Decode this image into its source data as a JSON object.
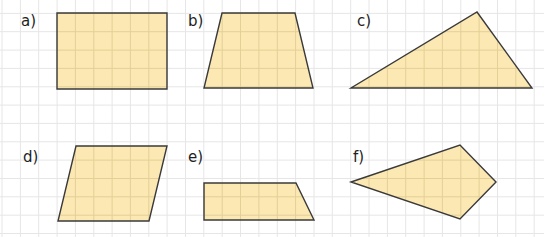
{
  "figure": {
    "grid": {
      "cell_px": 18.35,
      "origin_x": 2.0,
      "origin_y": -5.0,
      "line_color": "#e6e6e6",
      "extent_x": [
        0,
        544
      ],
      "extent_y": [
        0,
        237
      ]
    },
    "colors": {
      "fill": "#fbe8b3",
      "inner_grid": "#e3cf97",
      "stroke": "#3a3a3a",
      "label": "#1e1e1e"
    },
    "shapes": [
      {
        "id": "a",
        "label": "a)",
        "type": "rectangle",
        "label_pos": [
          21,
          14
        ],
        "points": [
          [
            57,
            13
          ],
          [
            167,
            13
          ],
          [
            167,
            89
          ],
          [
            57,
            89
          ]
        ]
      },
      {
        "id": "b",
        "label": "b)",
        "type": "trapezoid",
        "label_pos": [
          188,
          14
        ],
        "points": [
          [
            222,
            13
          ],
          [
            295,
            13
          ],
          [
            313,
            88
          ],
          [
            204,
            88
          ]
        ]
      },
      {
        "id": "c",
        "label": "c)",
        "type": "triangle",
        "label_pos": [
          357,
          14
        ],
        "points": [
          [
            477,
            12
          ],
          [
            532,
            88
          ],
          [
            351,
            88
          ]
        ]
      },
      {
        "id": "d",
        "label": "d)",
        "type": "parallelogram",
        "label_pos": [
          23,
          150
        ],
        "points": [
          [
            76,
            146
          ],
          [
            167,
            146
          ],
          [
            149,
            221
          ],
          [
            58,
            221
          ]
        ]
      },
      {
        "id": "e",
        "label": "e)",
        "type": "right-trapezoid",
        "label_pos": [
          188,
          150
        ],
        "points": [
          [
            204,
            183
          ],
          [
            296,
            183
          ],
          [
            314,
            220
          ],
          [
            204,
            220
          ]
        ]
      },
      {
        "id": "f",
        "label": "f)",
        "type": "kite",
        "label_pos": [
          353,
          150
        ],
        "points": [
          [
            351,
            182
          ],
          [
            460,
            145
          ],
          [
            496,
            182
          ],
          [
            460,
            219
          ]
        ]
      }
    ]
  }
}
